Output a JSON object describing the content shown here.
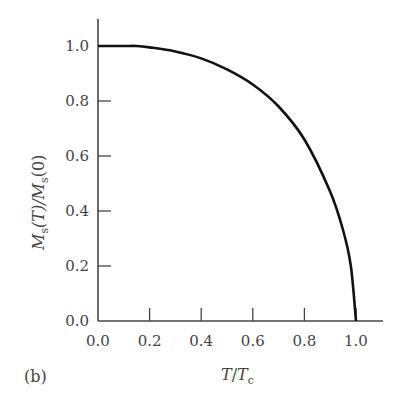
{
  "panel_label": "(b)",
  "chart_data": {
    "type": "line",
    "title": "",
    "xlabel": "T/Tc",
    "ylabel": "Ms(T)/Ms(0)",
    "xlim": [
      0.0,
      1.1
    ],
    "ylim": [
      0.0,
      1.1
    ],
    "grid": false,
    "x_ticks": [
      "0.0",
      "0.2",
      "0.4",
      "0.6",
      "0.8",
      "1.0"
    ],
    "y_ticks": [
      "0.0",
      "0.2",
      "0.4",
      "0.6",
      "0.8",
      "1.0"
    ],
    "series": [
      {
        "name": "Ms(T)/Ms(0)",
        "x": [
          0.0,
          0.1,
          0.15,
          0.2,
          0.3,
          0.4,
          0.5,
          0.6,
          0.7,
          0.8,
          0.9,
          0.95,
          0.98,
          1.0
        ],
        "y": [
          1.0,
          1.0,
          1.0,
          0.995,
          0.98,
          0.955,
          0.915,
          0.86,
          0.78,
          0.66,
          0.47,
          0.33,
          0.2,
          0.0
        ]
      }
    ]
  },
  "labels": {
    "x_axis": {
      "main": "T",
      "slash": "/",
      "main2": "T",
      "sub": "c"
    },
    "y_axis": {
      "main": "M",
      "sub": "s",
      "arg": "(T)/",
      "main2": "M",
      "sub2": "s",
      "arg2": "(0)"
    }
  }
}
